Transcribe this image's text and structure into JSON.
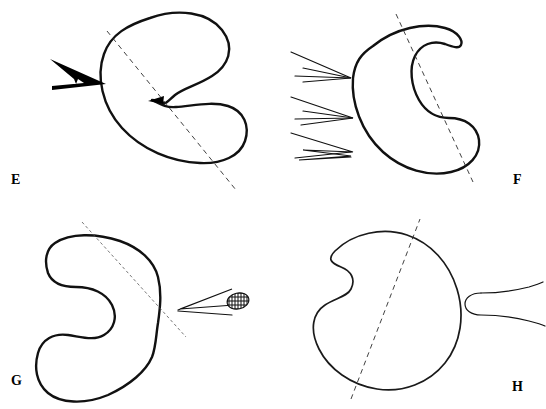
{
  "figure": {
    "type": "anatomical-section-plate",
    "background_color": "#ffffff",
    "ink_color": "#111111",
    "layout": "2x2 grid of four labelled panels",
    "panel_count": 4
  },
  "panels": [
    {
      "id": "E",
      "label": "E",
      "label_position": "bottom-left",
      "outline_description": "kidney-shaped body outline with deep notch on the left side, opening toward lower right",
      "section_line": {
        "style": "dashed",
        "orientation": "upper-left to lower-right diagonal"
      },
      "markers": [
        {
          "name": "solid-wedge-arrow",
          "description": "filled black wedge pointing right, placed left of the outline",
          "fill": "#000000"
        },
        {
          "name": "inner-notch-wedge",
          "description": "small filled black wedge at the concavity of the outline",
          "fill": "#000000"
        }
      ]
    },
    {
      "id": "F",
      "label": "F",
      "label_position": "bottom-right",
      "outline_description": "crescent C-shaped outline opening to the right with a hooked upper arm",
      "section_line": {
        "style": "dashed",
        "orientation": "upper-left to lower-right steep diagonal"
      },
      "markers": [
        {
          "name": "wedge-arrow-1",
          "description": "narrow open wedge mark pointing right",
          "fill": "none"
        },
        {
          "name": "wedge-arrow-2",
          "description": "narrow open wedge mark pointing right",
          "fill": "none"
        },
        {
          "name": "wedge-arrow-3",
          "description": "narrow zig-zag wedge mark pointing right",
          "fill": "none"
        }
      ]
    },
    {
      "id": "G",
      "label": "G",
      "label_position": "bottom-left",
      "outline_description": "broad kidney outline with deep concavity opening to the right",
      "section_line": {
        "style": "dashed",
        "orientation": "upper-left to lower-right diagonal, fine dashes"
      },
      "markers": [
        {
          "name": "wedge-arrow-left-pointing",
          "description": "slim open wedge pointing left",
          "fill": "none"
        },
        {
          "name": "hatched-oval",
          "description": "small cross-hatched dark ellipse at the right tip of the wedge",
          "fill": "#1a1a1a"
        }
      ]
    },
    {
      "id": "H",
      "label": "H",
      "label_position": "bottom-right",
      "outline_description": "bean-shaped outline with concavity on the left side",
      "section_line": {
        "style": "dashed",
        "orientation": "lower-left to upper-right steep diagonal"
      },
      "markers": [
        {
          "name": "bulb-tapered-marker",
          "description": "rounded bulb on the left tapering into two diverging thin lines to the right",
          "fill": "none"
        }
      ]
    }
  ]
}
